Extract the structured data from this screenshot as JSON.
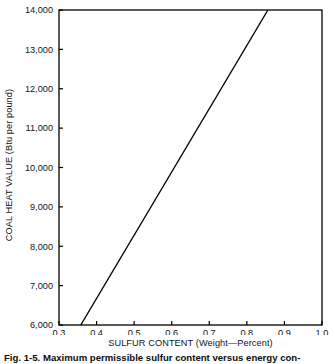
{
  "chart_data": {
    "type": "line",
    "title": "",
    "xlabel": "SULFUR CONTENT (Weight—Percent)",
    "ylabel": "COAL HEAT VALUE (Btu per pound)",
    "xlim": [
      0.3,
      1.0
    ],
    "ylim": [
      6000,
      14000
    ],
    "xticks": [
      0.3,
      0.4,
      0.5,
      0.6,
      0.7,
      0.8,
      0.9,
      1.0
    ],
    "xtick_labels": [
      "0.3",
      "0.4",
      "0.5",
      "0.6",
      "0.7",
      "0.8",
      "0.9",
      "1.0"
    ],
    "yticks": [
      6000,
      7000,
      8000,
      9000,
      10000,
      11000,
      12000,
      13000,
      14000
    ],
    "ytick_labels": [
      "6,000",
      "7,000",
      "8,000",
      "9,000",
      "10,000",
      "11,000",
      "12,000",
      "13,000",
      "14,000"
    ],
    "grid": false,
    "legend": null,
    "series": [
      {
        "name": "Maximum permissible sulfur content",
        "x": [
          0.358,
          0.856
        ],
        "y": [
          6000,
          14000
        ],
        "color": "#000000",
        "linewidth": 1.4
      }
    ],
    "annotations": []
  },
  "axes": {
    "y_title": "COAL HEAT VALUE (Btu per pound)",
    "x_title": "SULFUR CONTENT (Weight—Percent)"
  },
  "caption": {
    "label": "Fig. 1-5.",
    "text": "Maximum permissible sulfur content versus energy con-"
  }
}
